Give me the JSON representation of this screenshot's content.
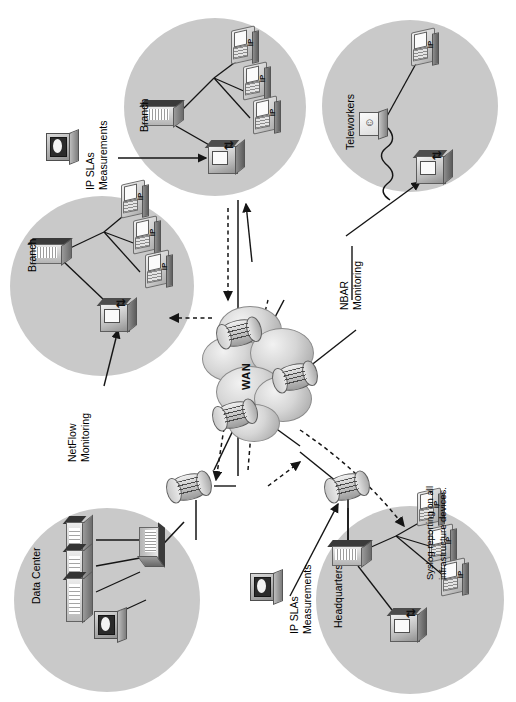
{
  "page": {
    "header_fragment": "",
    "background": "#ffffff",
    "blob_color": "#c9c9c9",
    "line_color": "#1a1a1a",
    "orientation": "rotated-90-ccw"
  },
  "diagram": {
    "type": "network-topology",
    "cloud": {
      "label": "WAN"
    },
    "sites": [
      {
        "id": "branch-top",
        "label": "Branch",
        "phones": 3,
        "has_switch": true,
        "has_multilayer_switch": true
      },
      {
        "id": "teleworkers",
        "label": "Teleworkers",
        "phones": 1,
        "has_host": true,
        "has_multilayer_switch": true
      },
      {
        "id": "branch-left",
        "label": "Branch",
        "phones": 3,
        "has_switch": true,
        "has_multilayer_switch": true
      },
      {
        "id": "data-center",
        "label": "Data Center",
        "servers": 3,
        "has_switch": true,
        "has_storage": true
      },
      {
        "id": "headquarters",
        "label": "Headquarters",
        "phones": 3,
        "has_switch": true,
        "has_multilayer_switch": true
      }
    ],
    "annotations": [
      {
        "id": "ipsla-top",
        "line1": "IP SLAs",
        "line2": "Measurements"
      },
      {
        "id": "nbar",
        "line1": "NBAR",
        "line2": "Monitoring"
      },
      {
        "id": "netflow",
        "line1": "NetFlow",
        "line2": "Monitoring"
      },
      {
        "id": "ipsla-bottom",
        "line1": "IP SLAs",
        "line2": "Measurements"
      },
      {
        "id": "syslog",
        "line1": "Syslog reporting on all",
        "line2": "infrastructure devices."
      }
    ],
    "icon_names": [
      "ip-phone-icon",
      "ethernet-switch-icon",
      "router-icon",
      "multilayer-switch-icon",
      "server-rack-icon",
      "wan-cloud-icon",
      "ip-sla-probe-icon",
      "teleworker-host-icon",
      "storage-icon",
      "solid-connector-line",
      "dashed-flow-arrow"
    ]
  }
}
